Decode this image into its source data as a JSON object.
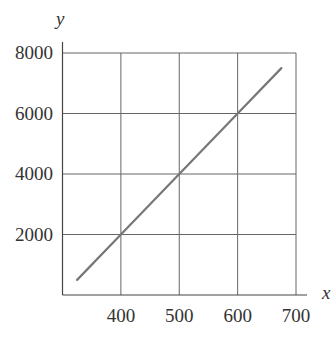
{
  "chart_data": {
    "type": "line",
    "title": "",
    "xlabel": "x",
    "ylabel": "y",
    "xlim": [
      300,
      700
    ],
    "ylim": [
      0,
      8000
    ],
    "x_ticks": [
      400,
      500,
      600,
      700
    ],
    "y_ticks": [
      2000,
      4000,
      6000,
      8000
    ],
    "x_tick_labels": [
      "400",
      "500",
      "600",
      "700"
    ],
    "y_tick_labels": [
      "2000",
      "4000",
      "6000",
      "8000"
    ],
    "grid": true,
    "legend": null,
    "series": [
      {
        "name": "y = 20x - 6000",
        "x": [
          325,
          400,
          500,
          600,
          675
        ],
        "y": [
          500,
          2000,
          4000,
          6000,
          7500
        ],
        "color": "#777777"
      }
    ]
  },
  "layout": {
    "plot_left": 62.5,
    "plot_right": 296,
    "plot_top": 53,
    "plot_bottom": 295,
    "axis_extend_right": 307,
    "axis_extend_top": 42,
    "grid_color": "#666666",
    "axis_color": "#444444"
  }
}
